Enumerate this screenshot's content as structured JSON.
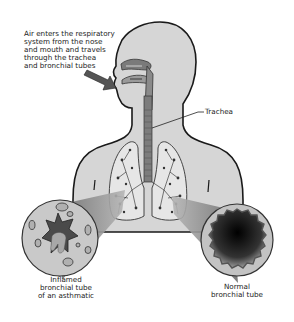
{
  "diagram": {
    "labels": {
      "intro": [
        "Air enters the respiratory",
        "system from the nose",
        "and mouth and travels",
        "through the trachea",
        "and bronchial tubes"
      ],
      "trachea": "Trachea",
      "inflamed": [
        "Inflamed",
        "bronchial tube",
        "of an asthmatic"
      ],
      "normal": [
        "Normal",
        "bronchial tube"
      ]
    },
    "parts": [
      "head",
      "nasal-cavity",
      "mouth",
      "trachea",
      "left-lung",
      "right-lung",
      "air-arrow",
      "inflamed-bronchial-tube",
      "normal-bronchial-tube"
    ],
    "colors": {
      "body_fill": "#d6d6d6",
      "outline": "#1a1a1a",
      "lung_fill": "#e4e4e4",
      "tube_fill": "#8a8a8a",
      "inflamed_lumen": "#4a4a4a",
      "normal_lumen_dark": "#111111",
      "text": "#222222"
    }
  }
}
